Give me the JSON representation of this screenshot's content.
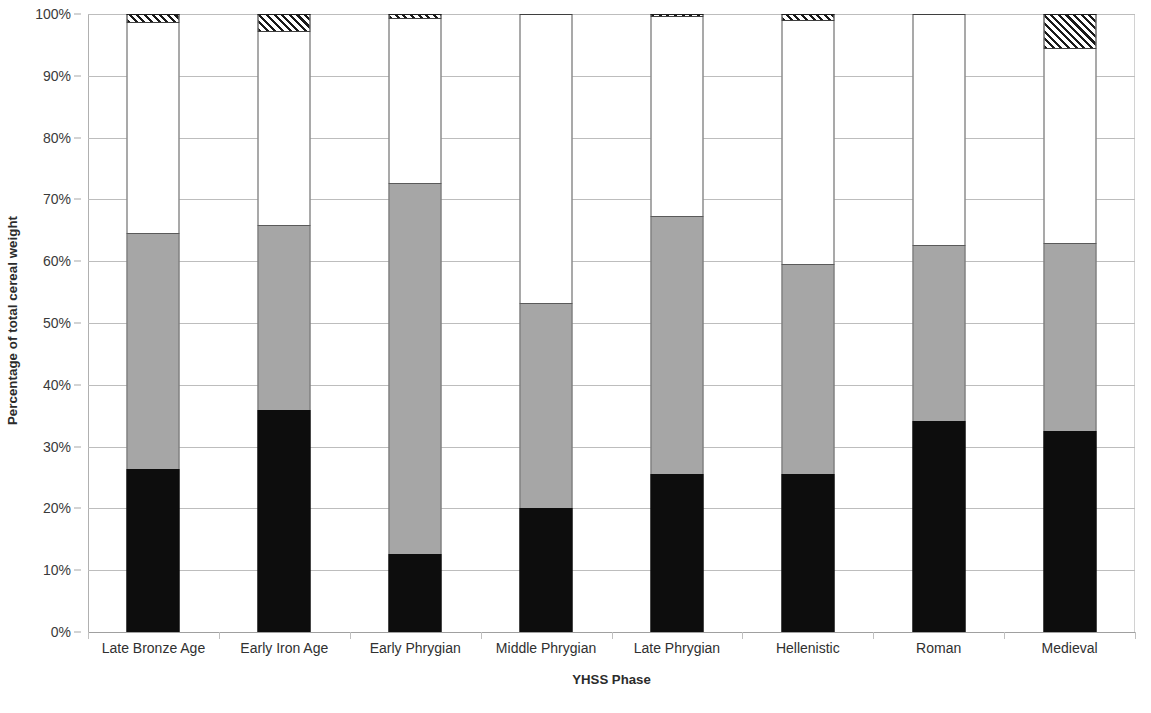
{
  "chart_data": {
    "type": "bar",
    "subtype": "stacked-100-percent",
    "title": "",
    "xlabel": "YHSS Phase",
    "ylabel": "Percentage of total cereal weight",
    "ylim": [
      0,
      100
    ],
    "ytick_labels": [
      "0%",
      "10%",
      "20%",
      "30%",
      "40%",
      "50%",
      "60%",
      "70%",
      "80%",
      "90%",
      "100%"
    ],
    "ytick_values": [
      0,
      10,
      20,
      30,
      40,
      50,
      60,
      70,
      80,
      90,
      100
    ],
    "grid": true,
    "legend": "none",
    "categories": [
      "Late Bronze Age",
      "Early Iron Age",
      "Early Phrygian",
      "Middle Phrygian",
      "Late Phrygian",
      "Hellenistic",
      "Roman",
      "Medieval"
    ],
    "series": [
      {
        "name": "black-segment",
        "order": 1,
        "fill": "solid-black",
        "color": "#0d0d0d",
        "values": [
          26.3,
          35.9,
          12.7,
          20.0,
          25.6,
          25.6,
          34.1,
          32.6
        ]
      },
      {
        "name": "gray-segment",
        "order": 2,
        "fill": "solid-gray",
        "color": "#a6a6a6",
        "values": [
          38.3,
          29.9,
          60.0,
          33.2,
          41.7,
          33.9,
          28.5,
          30.4
        ]
      },
      {
        "name": "white-segment",
        "order": 3,
        "fill": "solid-white",
        "color": "#ffffff",
        "values": [
          34.1,
          31.4,
          26.6,
          46.8,
          32.3,
          39.5,
          37.4,
          31.5
        ]
      },
      {
        "name": "hatched-segment",
        "order": 4,
        "fill": "diagonal-hatch",
        "color": "#ffffff",
        "values": [
          1.3,
          2.8,
          0.7,
          0.0,
          0.4,
          1.0,
          0.0,
          5.5
        ]
      }
    ],
    "cumulative_tops": [
      [
        26.3,
        64.6,
        98.7,
        100.0
      ],
      [
        35.9,
        65.8,
        97.2,
        100.0
      ],
      [
        12.7,
        72.7,
        99.3,
        100.0
      ],
      [
        20.0,
        53.2,
        100.0,
        100.0
      ],
      [
        25.6,
        67.3,
        99.6,
        100.0
      ],
      [
        25.6,
        59.5,
        99.0,
        100.0
      ],
      [
        34.1,
        62.6,
        100.0,
        100.0
      ],
      [
        32.6,
        63.0,
        94.5,
        100.0
      ]
    ]
  },
  "colors": {
    "black": "#0d0d0d",
    "gray": "#a6a6a6",
    "white": "#ffffff",
    "hatch_line": "#1a1a1a",
    "gridline": "#bdbdbd",
    "axis": "#a8a8a8",
    "text": "#303030"
  }
}
